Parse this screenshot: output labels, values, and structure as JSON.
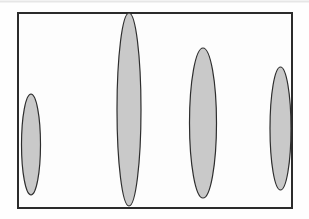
{
  "figure": {
    "canvas": {
      "width": 309,
      "height": 219,
      "background": "#fefefe"
    },
    "top_rule": {
      "x1": 0,
      "y1": 1.5,
      "x2": 309,
      "y2": 1.5,
      "color": "#e6e6e6",
      "stroke_width": 2
    },
    "frame": {
      "x": 18,
      "y": 13,
      "width": 274,
      "height": 195,
      "fill": "#fdfdfd",
      "stroke": "#2b2b2b",
      "stroke_width": 2
    },
    "ellipse_style": {
      "fill": "#c9c9c9",
      "stroke": "#2e2e2e",
      "stroke_width": 1.2
    },
    "ellipses": [
      {
        "id": "gray-ellipse-1",
        "cx": 31,
        "cy": 144.5,
        "rx": 9.5,
        "ry": 50.5
      },
      {
        "id": "gray-ellipse-2",
        "cx": 129,
        "cy": 109.5,
        "rx": 12,
        "ry": 96.5
      },
      {
        "id": "gray-ellipse-3",
        "cx": 203,
        "cy": 123,
        "rx": 13.5,
        "ry": 75
      },
      {
        "id": "gray-ellipse-4",
        "cx": 280.5,
        "cy": 128.5,
        "rx": 10.5,
        "ry": 61.5
      }
    ]
  }
}
